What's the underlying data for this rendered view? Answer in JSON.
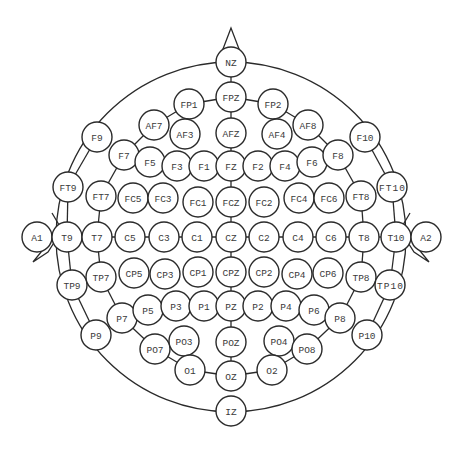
{
  "diagram": {
    "colors": {
      "stroke": "#2a2a2a",
      "text": "#3a3a3a",
      "background": "#ffffff"
    },
    "head": {
      "cx": 231,
      "cy": 237,
      "r": 175
    },
    "electrode_radius": 15,
    "electrodes": [
      {
        "label": "NZ",
        "x": 231,
        "y": 62
      },
      {
        "label": "FPZ",
        "x": 231,
        "y": 97
      },
      {
        "label": "FP1",
        "x": 189,
        "y": 104
      },
      {
        "label": "FP2",
        "x": 273,
        "y": 104
      },
      {
        "label": "AF7",
        "x": 154,
        "y": 125
      },
      {
        "label": "AF3",
        "x": 185,
        "y": 134
      },
      {
        "label": "AFZ",
        "x": 231,
        "y": 133
      },
      {
        "label": "AF4",
        "x": 277,
        "y": 134
      },
      {
        "label": "AF8",
        "x": 308,
        "y": 125
      },
      {
        "label": "F9",
        "x": 97,
        "y": 137
      },
      {
        "label": "F7",
        "x": 124,
        "y": 155
      },
      {
        "label": "F5",
        "x": 150,
        "y": 162
      },
      {
        "label": "F3",
        "x": 177,
        "y": 166
      },
      {
        "label": "F1",
        "x": 204,
        "y": 166
      },
      {
        "label": "FZ",
        "x": 231,
        "y": 166
      },
      {
        "label": "F2",
        "x": 258,
        "y": 166
      },
      {
        "label": "F4",
        "x": 285,
        "y": 166
      },
      {
        "label": "F6",
        "x": 312,
        "y": 162
      },
      {
        "label": "F8",
        "x": 338,
        "y": 155
      },
      {
        "label": "F10",
        "x": 365,
        "y": 137
      },
      {
        "label": "FT9",
        "x": 68,
        "y": 187
      },
      {
        "label": "FT7",
        "x": 101,
        "y": 196
      },
      {
        "label": "FC5",
        "x": 133,
        "y": 198
      },
      {
        "label": "FC3",
        "x": 163,
        "y": 198
      },
      {
        "label": "FC1",
        "x": 198,
        "y": 202
      },
      {
        "label": "FCZ",
        "x": 231,
        "y": 202
      },
      {
        "label": "FC2",
        "x": 264,
        "y": 202
      },
      {
        "label": "FC4",
        "x": 299,
        "y": 198
      },
      {
        "label": "FC6",
        "x": 329,
        "y": 198
      },
      {
        "label": "FT8",
        "x": 361,
        "y": 196
      },
      {
        "label": "FT10",
        "x": 392,
        "y": 187
      },
      {
        "label": "A1",
        "x": 37,
        "y": 237
      },
      {
        "label": "T9",
        "x": 67,
        "y": 237
      },
      {
        "label": "T7",
        "x": 97,
        "y": 237
      },
      {
        "label": "C5",
        "x": 130,
        "y": 237
      },
      {
        "label": "C3",
        "x": 164,
        "y": 237
      },
      {
        "label": "C1",
        "x": 197,
        "y": 237
      },
      {
        "label": "CZ",
        "x": 231,
        "y": 237
      },
      {
        "label": "C2",
        "x": 264,
        "y": 237
      },
      {
        "label": "C4",
        "x": 298,
        "y": 237
      },
      {
        "label": "C6",
        "x": 331,
        "y": 237
      },
      {
        "label": "T8",
        "x": 364,
        "y": 237
      },
      {
        "label": "T10",
        "x": 396,
        "y": 237
      },
      {
        "label": "A2",
        "x": 426,
        "y": 237
      },
      {
        "label": "TP9",
        "x": 72,
        "y": 285
      },
      {
        "label": "TP7",
        "x": 101,
        "y": 277
      },
      {
        "label": "CP5",
        "x": 134,
        "y": 273
      },
      {
        "label": "CP3",
        "x": 165,
        "y": 274
      },
      {
        "label": "CP1",
        "x": 198,
        "y": 272
      },
      {
        "label": "CPZ",
        "x": 231,
        "y": 272
      },
      {
        "label": "CP2",
        "x": 264,
        "y": 272
      },
      {
        "label": "CP4",
        "x": 297,
        "y": 274
      },
      {
        "label": "CP6",
        "x": 328,
        "y": 273
      },
      {
        "label": "TP8",
        "x": 361,
        "y": 277
      },
      {
        "label": "TP10",
        "x": 390,
        "y": 285
      },
      {
        "label": "P9",
        "x": 96,
        "y": 335
      },
      {
        "label": "P7",
        "x": 122,
        "y": 318
      },
      {
        "label": "P5",
        "x": 148,
        "y": 310
      },
      {
        "label": "P3",
        "x": 176,
        "y": 306
      },
      {
        "label": "P1",
        "x": 204,
        "y": 306
      },
      {
        "label": "PZ",
        "x": 231,
        "y": 306
      },
      {
        "label": "P2",
        "x": 258,
        "y": 306
      },
      {
        "label": "P4",
        "x": 286,
        "y": 306
      },
      {
        "label": "P6",
        "x": 314,
        "y": 310
      },
      {
        "label": "P8",
        "x": 340,
        "y": 318
      },
      {
        "label": "P10",
        "x": 367,
        "y": 335
      },
      {
        "label": "PO7",
        "x": 155,
        "y": 349
      },
      {
        "label": "PO3",
        "x": 184,
        "y": 341
      },
      {
        "label": "POZ",
        "x": 231,
        "y": 342
      },
      {
        "label": "PO4",
        "x": 279,
        "y": 341
      },
      {
        "label": "PO8",
        "x": 307,
        "y": 349
      },
      {
        "label": "O1",
        "x": 190,
        "y": 370
      },
      {
        "label": "OZ",
        "x": 231,
        "y": 376
      },
      {
        "label": "O2",
        "x": 272,
        "y": 370
      },
      {
        "label": "IZ",
        "x": 231,
        "y": 411
      }
    ],
    "connections": [
      [
        "NZ",
        "FPZ"
      ],
      [
        "FPZ",
        "AFZ"
      ],
      [
        "AFZ",
        "FZ"
      ],
      [
        "FZ",
        "FCZ"
      ],
      [
        "FCZ",
        "CZ"
      ],
      [
        "CZ",
        "CPZ"
      ],
      [
        "CPZ",
        "PZ"
      ],
      [
        "PZ",
        "POZ"
      ],
      [
        "POZ",
        "OZ"
      ],
      [
        "FP1",
        "FPZ"
      ],
      [
        "FPZ",
        "FP2"
      ],
      [
        "FP1",
        "AF7"
      ],
      [
        "AF7",
        "F7"
      ],
      [
        "F7",
        "FT7"
      ],
      [
        "FT7",
        "T7"
      ],
      [
        "T7",
        "TP7"
      ],
      [
        "TP7",
        "P7"
      ],
      [
        "P7",
        "PO7"
      ],
      [
        "PO7",
        "O1"
      ],
      [
        "O1",
        "OZ"
      ],
      [
        "FP2",
        "AF8"
      ],
      [
        "AF8",
        "F8"
      ],
      [
        "F8",
        "FT8"
      ],
      [
        "FT8",
        "T8"
      ],
      [
        "T8",
        "TP8"
      ],
      [
        "TP8",
        "P8"
      ],
      [
        "P8",
        "PO8"
      ],
      [
        "PO8",
        "O2"
      ],
      [
        "O2",
        "OZ"
      ],
      [
        "F9",
        "FT9"
      ],
      [
        "FT9",
        "T9"
      ],
      [
        "T9",
        "TP9"
      ],
      [
        "TP9",
        "P9"
      ],
      [
        "F10",
        "FT10"
      ],
      [
        "FT10",
        "T10"
      ],
      [
        "T10",
        "TP10"
      ],
      [
        "TP10",
        "P10"
      ],
      [
        "A1",
        "T9"
      ],
      [
        "T9",
        "T7"
      ],
      [
        "T7",
        "C5"
      ],
      [
        "C5",
        "C3"
      ],
      [
        "C3",
        "C1"
      ],
      [
        "C1",
        "CZ"
      ],
      [
        "CZ",
        "C2"
      ],
      [
        "C2",
        "C4"
      ],
      [
        "C4",
        "C6"
      ],
      [
        "C6",
        "T8"
      ],
      [
        "T8",
        "T10"
      ],
      [
        "T10",
        "A2"
      ]
    ],
    "nose": {
      "points": "231,28 218,62 244,62"
    },
    "ear_left": {
      "points": "52,213 62,230 48,252 33,262 46,246 40,230"
    },
    "ear_right": {
      "points": "410,213 400,230 414,252 429,262 416,246 422,230"
    }
  }
}
